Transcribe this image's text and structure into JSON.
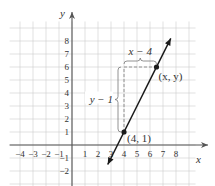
{
  "chart_data": {
    "type": "line",
    "title": "",
    "xlabel": "x",
    "ylabel": "y",
    "xlim": [
      -4.5,
      9.5
    ],
    "ylim": [
      -3.5,
      9.5
    ],
    "x_ticks": [
      "-4",
      "-3",
      "-2",
      "-1",
      "1",
      "2",
      "3",
      "4",
      "5",
      "6",
      "7",
      "8"
    ],
    "y_ticks": [
      "8",
      "7",
      "6",
      "5",
      "4",
      "3",
      "2",
      "1",
      "-1",
      "-2"
    ],
    "grid": true,
    "line": {
      "slope": 2,
      "intercept": -7,
      "color": "#1a1a1a"
    },
    "points": [
      {
        "x": 4,
        "y": 1,
        "label": "(4, 1)"
      },
      {
        "x": 6.5,
        "y": 6,
        "label": "(x, y)"
      }
    ],
    "annotations": [
      {
        "text": "x − 4",
        "kind": "horizontal-brace"
      },
      {
        "text": "y − 1",
        "kind": "vertical-brace"
      }
    ]
  },
  "colors": {
    "grid": "#cccccc",
    "axis": "#555555",
    "line": "#1a1a1a",
    "dashed": "#888888",
    "label": "#333333"
  }
}
